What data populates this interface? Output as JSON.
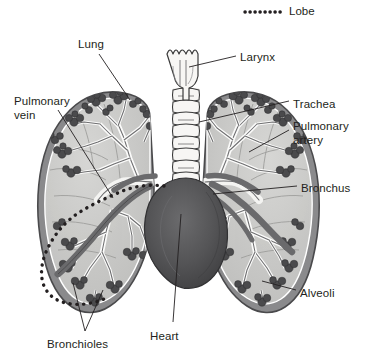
{
  "figure": {
    "background_color": "#ffffff",
    "ink_color": "#231f20"
  },
  "legend": {
    "swatch_name": "dotted-line-swatch",
    "swatch_style": "dotted",
    "swatch_color": "#231f20",
    "label": "Lobe"
  },
  "labels": [
    {
      "id": "lung",
      "text": "Lung",
      "x": 78,
      "y": 38,
      "align": "left"
    },
    {
      "id": "larynx",
      "text": "Larynx",
      "x": 240,
      "y": 51,
      "align": "left"
    },
    {
      "id": "pulmonary_vein",
      "text": "Pulmonary\nvein",
      "x": 14,
      "y": 95,
      "align": "left"
    },
    {
      "id": "trachea",
      "text": "Trachea",
      "x": 293,
      "y": 98,
      "align": "left"
    },
    {
      "id": "pulmonary_artery",
      "text": "Pulmonary\nartery",
      "x": 293,
      "y": 120,
      "align": "left"
    },
    {
      "id": "bronchus",
      "text": "Bronchus",
      "x": 301,
      "y": 182,
      "align": "left"
    },
    {
      "id": "alveoli",
      "text": "Alveoli",
      "x": 300,
      "y": 287,
      "align": "left"
    },
    {
      "id": "heart",
      "text": "Heart",
      "x": 150,
      "y": 330,
      "align": "left"
    },
    {
      "id": "bronchioles",
      "text": "Bronchioles",
      "x": 47,
      "y": 338,
      "align": "left"
    }
  ],
  "anatomy": {
    "parts": [
      {
        "name": "larynx",
        "fill": "#f2f1ef",
        "stroke": "#3a3a3a"
      },
      {
        "name": "trachea",
        "fill": "#f2f1ef",
        "stroke": "#3a3a3a"
      },
      {
        "name": "left-lung",
        "fill": "#c9c9c7",
        "stroke": "#58585a"
      },
      {
        "name": "right-lung",
        "fill": "#c9c9c7",
        "stroke": "#58585a"
      },
      {
        "name": "heart",
        "fill": "#4d4d4f",
        "stroke": "#3a3a3a"
      },
      {
        "name": "bronchial-tree",
        "fill": "#ffffff",
        "stroke": "#58585a"
      },
      {
        "name": "alveoli-clusters",
        "fill": "#4d4d4f",
        "stroke": "#3a3a3a"
      },
      {
        "name": "pulmonary-vessels",
        "fill": "#6d6e71",
        "stroke": "#58585a"
      },
      {
        "name": "lobe-boundary",
        "fill": "none",
        "stroke": "#231f20"
      }
    ]
  }
}
